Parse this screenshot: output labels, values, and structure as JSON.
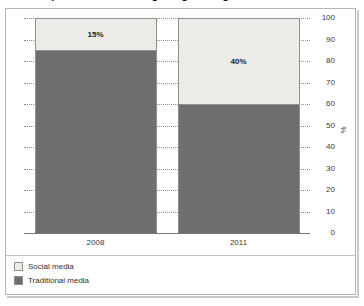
{
  "chart_data": {
    "type": "bar",
    "subtype": "stacked-bar-100",
    "title": "Proportion of marketing budget assigned to social media",
    "categories": [
      "2008",
      "2011"
    ],
    "series": [
      {
        "name": "Social media",
        "values": [
          15,
          40
        ],
        "color": "#ebebe7"
      },
      {
        "name": "Traditional media",
        "values": [
          85,
          60
        ],
        "color": "#6e6e6e"
      }
    ],
    "data_labels": [
      "15%",
      "40%"
    ],
    "xlabel": "",
    "ylabel": "%",
    "ylim": [
      0,
      100
    ],
    "ytick_step": 10,
    "yticks": [
      "100",
      "90",
      "80",
      "70",
      "60",
      "50",
      "40",
      "30",
      "20",
      "10",
      "0"
    ],
    "grid": true,
    "grid_style": "dotted",
    "axis_position": "right",
    "legend_position": "bottom-left"
  },
  "figure": {
    "axis_unit": "%",
    "frame_color": "#b4b4b4",
    "grid_color": "#8c8c8c",
    "axis_line_color": "#767676",
    "label_color": "#3a3a3a"
  },
  "legend": {
    "items": [
      {
        "label": "Social media",
        "color": "#ebebe7"
      },
      {
        "label": "Traditional media",
        "color": "#6e6e6e"
      }
    ]
  }
}
